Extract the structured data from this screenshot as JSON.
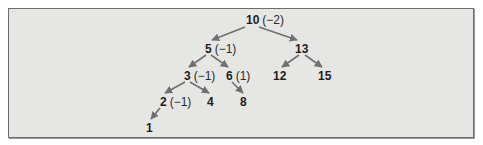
{
  "diagram": {
    "type": "binary-search-tree",
    "colors": {
      "background": "#e6e6e4",
      "border": "#6e6e6e",
      "edge": "#707070",
      "text": "#1e1e1e"
    },
    "nodes": [
      {
        "id": "n10",
        "key": "10",
        "balance": "(−2)",
        "x": 246,
        "y": 14
      },
      {
        "id": "n5",
        "key": "5",
        "balance": "(−1)",
        "x": 205,
        "y": 43
      },
      {
        "id": "n13",
        "key": "13",
        "balance": "",
        "x": 295,
        "y": 43
      },
      {
        "id": "n3",
        "key": "3",
        "balance": "(−1)",
        "x": 184,
        "y": 70
      },
      {
        "id": "n6",
        "key": "6",
        "balance": "(1)",
        "x": 226,
        "y": 70
      },
      {
        "id": "n12",
        "key": "12",
        "balance": "",
        "x": 273,
        "y": 70
      },
      {
        "id": "n15",
        "key": "15",
        "balance": "",
        "x": 318,
        "y": 70
      },
      {
        "id": "n2",
        "key": "2",
        "balance": "(−1)",
        "x": 160,
        "y": 96
      },
      {
        "id": "n4",
        "key": "4",
        "balance": "",
        "x": 207,
        "y": 96
      },
      {
        "id": "n8",
        "key": "8",
        "balance": "",
        "x": 240,
        "y": 96
      },
      {
        "id": "n1",
        "key": "1",
        "balance": "",
        "x": 146,
        "y": 122
      }
    ],
    "edges": [
      {
        "from": "10",
        "to": "5",
        "x1": 245,
        "y1": 27,
        "x2": 212,
        "y2": 40
      },
      {
        "from": "10",
        "to": "13",
        "x1": 259,
        "y1": 27,
        "x2": 297,
        "y2": 40
      },
      {
        "from": "5",
        "to": "3",
        "x1": 206,
        "y1": 55,
        "x2": 189,
        "y2": 67
      },
      {
        "from": "5",
        "to": "6",
        "x1": 211,
        "y1": 55,
        "x2": 228,
        "y2": 67
      },
      {
        "from": "13",
        "to": "12",
        "x1": 299,
        "y1": 55,
        "x2": 282,
        "y2": 67
      },
      {
        "from": "13",
        "to": "15",
        "x1": 305,
        "y1": 55,
        "x2": 322,
        "y2": 67
      },
      {
        "from": "3",
        "to": "2",
        "x1": 185,
        "y1": 82,
        "x2": 165,
        "y2": 93
      },
      {
        "from": "3",
        "to": "4",
        "x1": 190,
        "y1": 82,
        "x2": 209,
        "y2": 93
      },
      {
        "from": "6",
        "to": "8",
        "x1": 232,
        "y1": 82,
        "x2": 243,
        "y2": 93
      },
      {
        "from": "2",
        "to": "1",
        "x1": 160,
        "y1": 108,
        "x2": 151,
        "y2": 119
      }
    ]
  }
}
